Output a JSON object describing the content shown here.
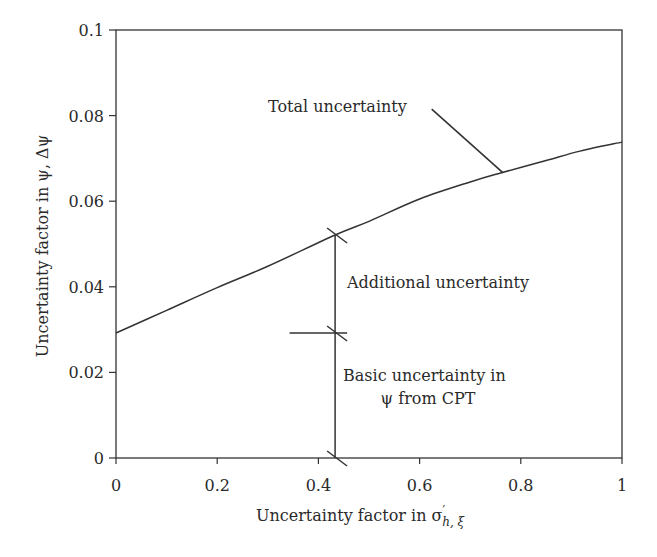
{
  "chart_data": {
    "type": "line",
    "title": "",
    "xlabel": "Uncertainty factor in σ′h, ξ",
    "xlabel_main": "Uncertainty factor in σ",
    "xlabel_prime": "′",
    "xlabel_sub": "h, ξ",
    "ylabel": "Uncertainty factor in ψ, Δψ",
    "xlim": [
      0,
      1
    ],
    "ylim": [
      0,
      0.1
    ],
    "grid": false,
    "legend": null,
    "x_ticks": [
      0,
      0.2,
      0.4,
      0.6,
      0.8,
      1
    ],
    "x_tick_labels": [
      "0",
      "0.2",
      "0.4",
      "0.6",
      "0.8",
      "1"
    ],
    "y_ticks": [
      0,
      0.02,
      0.04,
      0.06,
      0.08,
      0.1
    ],
    "y_tick_labels": [
      "0",
      "0.02",
      "0.04",
      "0.06",
      "0.08",
      "0.1"
    ],
    "series": [
      {
        "name": "Total uncertainty",
        "x": [
          0,
          0.1,
          0.2,
          0.3,
          0.433,
          0.5,
          0.6,
          0.7,
          0.76,
          0.85,
          0.917,
          1.0
        ],
        "values": [
          0.0292,
          0.0345,
          0.0398,
          0.0448,
          0.0521,
          0.0553,
          0.0605,
          0.0645,
          0.0666,
          0.0695,
          0.0717,
          0.0738
        ]
      }
    ],
    "annotations": [
      {
        "text": "Total uncertainty",
        "x": 0.3,
        "y": 0.081,
        "leader_from": [
          0.62,
          0.0815
        ],
        "leader_to": [
          0.765,
          0.0666
        ]
      },
      {
        "text": "Additional uncertainty",
        "x": 0.455,
        "y": 0.04,
        "bracket_x": 0.433,
        "from": 0.0292,
        "to": 0.0521
      },
      {
        "text": "Basic uncertainty in",
        "x": 0.45,
        "y": 0.018
      },
      {
        "text": "ψ from CPT",
        "x": 0.62,
        "y": 0.0128,
        "anchor": "middle"
      }
    ],
    "markers": {
      "bracket_x": 0.433,
      "basic_top": 0.0292,
      "additional_top": 0.0521,
      "horizontal_line_x_start": 0.343,
      "horizontal_line_y": 0.0292
    }
  }
}
